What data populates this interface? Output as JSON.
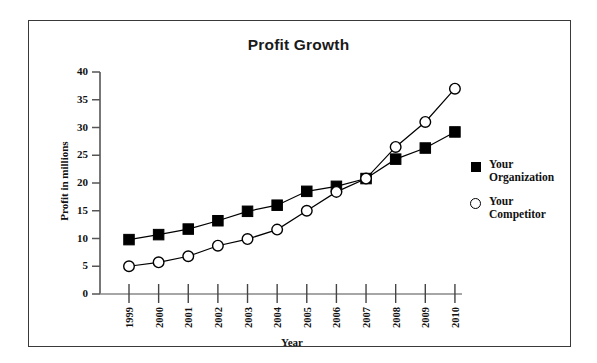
{
  "chart_data": {
    "type": "line",
    "title": "Profit Growth",
    "xlabel": "Year",
    "ylabel": "Profit in millions",
    "categories": [
      "1999",
      "2000",
      "2001",
      "2002",
      "2003",
      "2004",
      "2005",
      "2006",
      "2007",
      "2008",
      "2009",
      "2010"
    ],
    "series": [
      {
        "name": "Your Organization",
        "marker": "filled-square",
        "values": [
          9.8,
          10.7,
          11.7,
          13.2,
          14.9,
          16.0,
          18.5,
          19.4,
          20.8,
          24.3,
          26.3,
          29.2
        ]
      },
      {
        "name": "Your Competitor",
        "marker": "open-circle",
        "values": [
          5.0,
          5.7,
          6.8,
          8.7,
          9.9,
          11.6,
          15.0,
          18.4,
          20.8,
          26.5,
          31.0,
          37.0
        ]
      }
    ],
    "ylim": [
      0,
      40
    ],
    "yticks": [
      0,
      5,
      10,
      15,
      20,
      25,
      30,
      35,
      40
    ],
    "grid": false,
    "legend_position": "right",
    "legend_entries": [
      {
        "label_line1": "Your",
        "label_line2": "Organization",
        "marker": "filled-square"
      },
      {
        "label_line1": "Your",
        "label_line2": "Competitor",
        "marker": "open-circle"
      }
    ],
    "colors": {
      "series_line": "#000000",
      "axis": "#555555",
      "frame": "#3a3a3a",
      "background": "#ffffff",
      "text": "#111111"
    }
  }
}
